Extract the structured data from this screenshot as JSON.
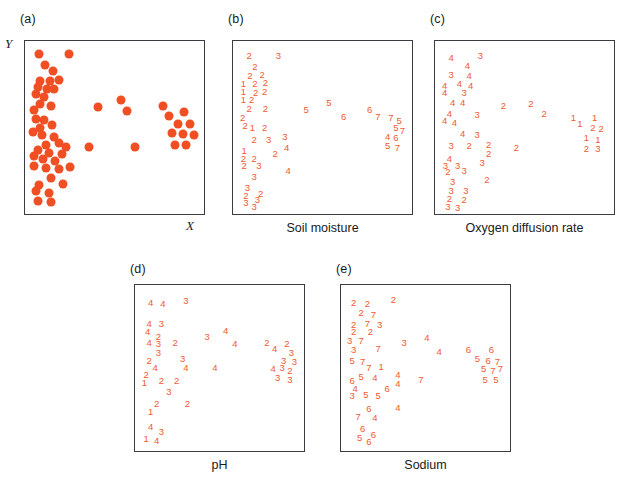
{
  "figure": {
    "type": "multi-panel-scatter-ordination",
    "background": "#ffffff",
    "marker_color": "#f04e23",
    "digit_color": "#ef5a32",
    "axis_color": "#3b3b46"
  },
  "panels": [
    {
      "tag": "(a)",
      "caption": "",
      "xlabel": "X",
      "ylabel": "Y",
      "mode": "dots"
    },
    {
      "tag": "(b)",
      "caption": "Soil moisture",
      "xlabel": "",
      "ylabel": "",
      "mode": "digits"
    },
    {
      "tag": "(c)",
      "caption": "Oxygen diffusion rate",
      "xlabel": "",
      "ylabel": "",
      "mode": "digits"
    },
    {
      "tag": "(d)",
      "caption": "pH",
      "xlabel": "",
      "ylabel": "",
      "mode": "digits"
    },
    {
      "tag": "(e)",
      "caption": "Sodium",
      "xlabel": "",
      "ylabel": "",
      "mode": "digits"
    }
  ],
  "chart_data": {
    "type": "scatter",
    "title": "",
    "xlabel": "X",
    "ylabel": "Y",
    "xlim": [
      0,
      100
    ],
    "ylim": [
      0,
      100
    ],
    "grid": false,
    "legend": "none",
    "points": [
      {
        "x": 5.0,
        "y": 96.0
      },
      {
        "x": 23.0,
        "y": 96.0
      },
      {
        "x": 8.5,
        "y": 89.0
      },
      {
        "x": 13.0,
        "y": 85.5
      },
      {
        "x": 5.5,
        "y": 79.5
      },
      {
        "x": 11.5,
        "y": 79.0
      },
      {
        "x": 16.5,
        "y": 80.0
      },
      {
        "x": 4.0,
        "y": 75.5
      },
      {
        "x": 9.5,
        "y": 74.5
      },
      {
        "x": 14.0,
        "y": 74.0
      },
      {
        "x": 3.0,
        "y": 71.0
      },
      {
        "x": 8.0,
        "y": 69.0
      },
      {
        "x": 5.5,
        "y": 64.5
      },
      {
        "x": 12.0,
        "y": 63.5
      },
      {
        "x": 1.5,
        "y": 61.0
      },
      {
        "x": 40.0,
        "y": 63.0
      },
      {
        "x": 54.0,
        "y": 67.5
      },
      {
        "x": 57.5,
        "y": 60.5
      },
      {
        "x": 79.0,
        "y": 63.5
      },
      {
        "x": 82.5,
        "y": 57.5
      },
      {
        "x": 91.5,
        "y": 59.5
      },
      {
        "x": 3.0,
        "y": 55.5
      },
      {
        "x": 8.0,
        "y": 55.0
      },
      {
        "x": 5.5,
        "y": 50.0
      },
      {
        "x": 12.5,
        "y": 51.5
      },
      {
        "x": 1.0,
        "y": 47.0
      },
      {
        "x": 6.5,
        "y": 45.5
      },
      {
        "x": 13.5,
        "y": 44.0
      },
      {
        "x": 88.0,
        "y": 52.0
      },
      {
        "x": 95.0,
        "y": 52.0
      },
      {
        "x": 84.5,
        "y": 46.5
      },
      {
        "x": 91.0,
        "y": 46.0
      },
      {
        "x": 97.5,
        "y": 45.5
      },
      {
        "x": 9.0,
        "y": 39.0
      },
      {
        "x": 17.0,
        "y": 40.5
      },
      {
        "x": 21.0,
        "y": 38.0
      },
      {
        "x": 4.0,
        "y": 36.0
      },
      {
        "x": 11.0,
        "y": 34.0
      },
      {
        "x": 18.5,
        "y": 33.5
      },
      {
        "x": 35.0,
        "y": 38.0
      },
      {
        "x": 62.0,
        "y": 37.5
      },
      {
        "x": 86.0,
        "y": 39.0
      },
      {
        "x": 93.0,
        "y": 39.0
      },
      {
        "x": 1.5,
        "y": 32.0
      },
      {
        "x": 7.0,
        "y": 30.0
      },
      {
        "x": 14.5,
        "y": 29.0
      },
      {
        "x": 2.0,
        "y": 26.0
      },
      {
        "x": 9.0,
        "y": 24.5
      },
      {
        "x": 16.5,
        "y": 24.0
      },
      {
        "x": 23.5,
        "y": 25.0
      },
      {
        "x": 12.0,
        "y": 18.5
      },
      {
        "x": 5.0,
        "y": 14.0
      },
      {
        "x": 19.0,
        "y": 14.5
      },
      {
        "x": 3.0,
        "y": 10.0
      },
      {
        "x": 10.5,
        "y": 8.5
      },
      {
        "x": 4.0,
        "y": 4.0
      },
      {
        "x": 12.0,
        "y": 3.0
      }
    ],
    "codes": {
      "soil_moisture": [
        2,
        3,
        2,
        2,
        2,
        1,
        2,
        2,
        1,
        2,
        2,
        1,
        2,
        2,
        2,
        5,
        5,
        6,
        6,
        7,
        7,
        2,
        1,
        2,
        2,
        2,
        3,
        3,
        4,
        5,
        7,
        6,
        7,
        1,
        3,
        4,
        2,
        2,
        3,
        4,
        5,
        7,
        5,
        2,
        2,
        2,
        3,
        3,
        3,
        4,
        3,
        3,
        2,
        2,
        3,
        3,
        3
      ],
      "oxygen_diffusion_rate": [
        4,
        3,
        4,
        4,
        3,
        4,
        4,
        4,
        4,
        3,
        4,
        4,
        4,
        3,
        4,
        2,
        2,
        2,
        1,
        1,
        1,
        4,
        4,
        4,
        3,
        3,
        3,
        2,
        2,
        2,
        1,
        1,
        1,
        3,
        2,
        2,
        4,
        3,
        2,
        3,
        2,
        2,
        3,
        3,
        3,
        3,
        2,
        2,
        3,
        2,
        3,
        3,
        3,
        2,
        2,
        3,
        3
      ],
      "ph": [
        4,
        3,
        4,
        4,
        3,
        2,
        4,
        4,
        3,
        2,
        4,
        3,
        2,
        3,
        3,
        3,
        4,
        2,
        4,
        2,
        2,
        2,
        4,
        2,
        4,
        1,
        2,
        2,
        3,
        3,
        3,
        3,
        3,
        2,
        4,
        2,
        2,
        3,
        2,
        4,
        4,
        4,
        3,
        1,
        2,
        3,
        2,
        1,
        2,
        4,
        3,
        1,
        4
      ],
      "sodium": [
        2,
        2,
        2,
        7,
        2,
        7,
        3,
        2,
        2,
        3,
        7,
        7,
        3,
        7,
        5,
        7,
        1,
        7,
        5,
        4,
        4,
        6,
        4,
        4,
        6,
        4,
        5,
        5,
        6,
        5,
        6,
        7,
        5,
        7,
        6,
        4,
        4,
        5,
        5,
        6,
        7,
        4,
        6,
        6,
        5,
        5
      ]
    }
  },
  "panel_b_digits": [
    {
      "x": 5,
      "y": 96,
      "v": "2"
    },
    {
      "x": 23,
      "y": 96,
      "v": "3"
    },
    {
      "x": 8.5,
      "y": 89,
      "v": "2"
    },
    {
      "x": 5.5,
      "y": 83,
      "v": "2"
    },
    {
      "x": 13,
      "y": 84,
      "v": "2"
    },
    {
      "x": 1.5,
      "y": 78,
      "v": "1"
    },
    {
      "x": 8.5,
      "y": 78,
      "v": "2"
    },
    {
      "x": 15,
      "y": 79,
      "v": "2"
    },
    {
      "x": 1.5,
      "y": 73,
      "v": "1"
    },
    {
      "x": 9,
      "y": 72,
      "v": "2"
    },
    {
      "x": 14.5,
      "y": 73,
      "v": "2"
    },
    {
      "x": 1.5,
      "y": 68,
      "v": "1"
    },
    {
      "x": 6.5,
      "y": 68,
      "v": "2"
    },
    {
      "x": 5,
      "y": 62,
      "v": "2"
    },
    {
      "x": 15,
      "y": 62,
      "v": "2"
    },
    {
      "x": 40,
      "y": 61,
      "v": "5"
    },
    {
      "x": 54,
      "y": 66,
      "v": "5"
    },
    {
      "x": 63,
      "y": 57,
      "v": "6"
    },
    {
      "x": 79,
      "y": 61,
      "v": "6"
    },
    {
      "x": 84,
      "y": 57,
      "v": "7"
    },
    {
      "x": 1,
      "y": 56,
      "v": "2"
    },
    {
      "x": 2.5,
      "y": 51,
      "v": "2"
    },
    {
      "x": 7,
      "y": 50,
      "v": "1"
    },
    {
      "x": 92,
      "y": 56,
      "v": "7"
    },
    {
      "x": 97,
      "y": 54,
      "v": "5"
    },
    {
      "x": 95,
      "y": 50,
      "v": "5"
    },
    {
      "x": 99,
      "y": 48,
      "v": "7"
    },
    {
      "x": 14.5,
      "y": 50,
      "v": "2"
    },
    {
      "x": 90,
      "y": 44,
      "v": "4"
    },
    {
      "x": 95,
      "y": 43,
      "v": "6"
    },
    {
      "x": 90,
      "y": 38,
      "v": "5"
    },
    {
      "x": 96,
      "y": 37,
      "v": "7"
    },
    {
      "x": 8,
      "y": 42,
      "v": "2"
    },
    {
      "x": 17,
      "y": 42,
      "v": "3"
    },
    {
      "x": 27,
      "y": 44,
      "v": "3"
    },
    {
      "x": 28,
      "y": 37,
      "v": "4"
    },
    {
      "x": 2,
      "y": 35,
      "v": "1"
    },
    {
      "x": 21,
      "y": 33,
      "v": "2"
    },
    {
      "x": 1.5,
      "y": 30,
      "v": "2"
    },
    {
      "x": 8,
      "y": 30,
      "v": "2"
    },
    {
      "x": 2,
      "y": 25,
      "v": "2"
    },
    {
      "x": 11,
      "y": 25,
      "v": "3"
    },
    {
      "x": 29,
      "y": 22,
      "v": "4"
    },
    {
      "x": 8,
      "y": 18,
      "v": "3"
    },
    {
      "x": 4,
      "y": 11,
      "v": "3"
    },
    {
      "x": 3,
      "y": 6,
      "v": "2"
    },
    {
      "x": 12,
      "y": 7,
      "v": "2"
    },
    {
      "x": 10,
      "y": 3,
      "v": "3"
    },
    {
      "x": 3,
      "y": 1,
      "v": "3"
    },
    {
      "x": 8,
      "y": -1,
      "v": "3"
    }
  ],
  "panel_c_digits": [
    {
      "x": 5,
      "y": 95,
      "v": "4"
    },
    {
      "x": 23,
      "y": 96,
      "v": "3"
    },
    {
      "x": 15,
      "y": 90,
      "v": "4"
    },
    {
      "x": 5,
      "y": 84,
      "v": "3"
    },
    {
      "x": 16,
      "y": 83,
      "v": "4"
    },
    {
      "x": 1,
      "y": 77,
      "v": "4"
    },
    {
      "x": 10,
      "y": 78,
      "v": "4"
    },
    {
      "x": 17,
      "y": 77,
      "v": "4"
    },
    {
      "x": 1,
      "y": 72,
      "v": "4"
    },
    {
      "x": 13,
      "y": 72,
      "v": "3"
    },
    {
      "x": 6,
      "y": 66,
      "v": "4"
    },
    {
      "x": 12,
      "y": 66,
      "v": "4"
    },
    {
      "x": 37,
      "y": 64,
      "v": "2"
    },
    {
      "x": 54,
      "y": 65,
      "v": "2"
    },
    {
      "x": 62,
      "y": 59,
      "v": "2"
    },
    {
      "x": 4,
      "y": 59,
      "v": "4"
    },
    {
      "x": 21,
      "y": 58,
      "v": "3"
    },
    {
      "x": 1,
      "y": 54,
      "v": "4"
    },
    {
      "x": 7,
      "y": 53,
      "v": "4"
    },
    {
      "x": 80,
      "y": 56,
      "v": "1"
    },
    {
      "x": 84,
      "y": 52,
      "v": "1"
    },
    {
      "x": 93,
      "y": 56,
      "v": "1"
    },
    {
      "x": 92,
      "y": 50,
      "v": "2"
    },
    {
      "x": 97,
      "y": 49,
      "v": "2"
    },
    {
      "x": 12,
      "y": 46,
      "v": "4"
    },
    {
      "x": 21,
      "y": 45,
      "v": "3"
    },
    {
      "x": 88,
      "y": 43,
      "v": "1"
    },
    {
      "x": 95,
      "y": 42,
      "v": "1"
    },
    {
      "x": 88,
      "y": 36,
      "v": "2"
    },
    {
      "x": 95,
      "y": 36,
      "v": "3"
    },
    {
      "x": 5,
      "y": 38,
      "v": "3"
    },
    {
      "x": 16,
      "y": 38,
      "v": "2"
    },
    {
      "x": 28,
      "y": 39,
      "v": "2"
    },
    {
      "x": 28,
      "y": 33,
      "v": "2"
    },
    {
      "x": 45,
      "y": 37,
      "v": "2"
    },
    {
      "x": 4,
      "y": 30,
      "v": "4"
    },
    {
      "x": 1.5,
      "y": 25,
      "v": "3"
    },
    {
      "x": 9,
      "y": 25,
      "v": "3"
    },
    {
      "x": 24,
      "y": 27,
      "v": "3"
    },
    {
      "x": 3,
      "y": 21,
      "v": "2"
    },
    {
      "x": 13,
      "y": 22,
      "v": "3"
    },
    {
      "x": 27,
      "y": 16,
      "v": "2"
    },
    {
      "x": 6,
      "y": 15,
      "v": "3"
    },
    {
      "x": 5,
      "y": 9,
      "v": "3"
    },
    {
      "x": 14,
      "y": 9,
      "v": "3"
    },
    {
      "x": 4,
      "y": 4,
      "v": "2"
    },
    {
      "x": 13,
      "y": 3,
      "v": "2"
    },
    {
      "x": 3,
      "y": -1,
      "v": "3"
    },
    {
      "x": 9,
      "y": -2,
      "v": "3"
    }
  ],
  "panel_d_digits": [
    {
      "x": 5,
      "y": 94,
      "v": "4"
    },
    {
      "x": 13,
      "y": 93,
      "v": "4"
    },
    {
      "x": 28,
      "y": 95,
      "v": "3"
    },
    {
      "x": 4,
      "y": 80,
      "v": "4"
    },
    {
      "x": 12,
      "y": 80,
      "v": "3"
    },
    {
      "x": 3,
      "y": 74,
      "v": "4"
    },
    {
      "x": 10,
      "y": 71,
      "v": "2"
    },
    {
      "x": 42,
      "y": 71,
      "v": "3"
    },
    {
      "x": 54,
      "y": 75,
      "v": "4"
    },
    {
      "x": 4,
      "y": 67,
      "v": "4"
    },
    {
      "x": 10,
      "y": 66,
      "v": "3"
    },
    {
      "x": 21,
      "y": 67,
      "v": "2"
    },
    {
      "x": 60,
      "y": 66,
      "v": "4"
    },
    {
      "x": 81,
      "y": 67,
      "v": "2"
    },
    {
      "x": 86,
      "y": 63,
      "v": "4"
    },
    {
      "x": 94,
      "y": 66,
      "v": "2"
    },
    {
      "x": 10,
      "y": 60,
      "v": "3"
    },
    {
      "x": 97,
      "y": 60,
      "v": "3"
    },
    {
      "x": 4,
      "y": 55,
      "v": "2"
    },
    {
      "x": 26,
      "y": 56,
      "v": "3"
    },
    {
      "x": 92,
      "y": 55,
      "v": "3"
    },
    {
      "x": 99,
      "y": 54,
      "v": "3"
    },
    {
      "x": 8,
      "y": 50,
      "v": "4"
    },
    {
      "x": 28,
      "y": 50,
      "v": "4"
    },
    {
      "x": 47,
      "y": 50,
      "v": "4"
    },
    {
      "x": 85,
      "y": 49,
      "v": "4"
    },
    {
      "x": 91,
      "y": 50,
      "v": "3"
    },
    {
      "x": 96,
      "y": 48,
      "v": "2"
    },
    {
      "x": 2,
      "y": 45,
      "v": "2"
    },
    {
      "x": 88,
      "y": 43,
      "v": "3"
    },
    {
      "x": 96,
      "y": 42,
      "v": "3"
    },
    {
      "x": 1,
      "y": 40,
      "v": "1"
    },
    {
      "x": 12,
      "y": 41,
      "v": "2"
    },
    {
      "x": 22,
      "y": 41,
      "v": "2"
    },
    {
      "x": 17,
      "y": 34,
      "v": "3"
    },
    {
      "x": 9,
      "y": 26,
      "v": "2"
    },
    {
      "x": 29,
      "y": 26,
      "v": "2"
    },
    {
      "x": 5,
      "y": 20,
      "v": "1"
    },
    {
      "x": 5,
      "y": 10,
      "v": "4"
    },
    {
      "x": 12,
      "y": 7,
      "v": "3"
    },
    {
      "x": 2,
      "y": 2,
      "v": "1"
    },
    {
      "x": 9,
      "y": 1,
      "v": "4"
    }
  ],
  "panel_e_digits": [
    {
      "x": 3,
      "y": 94,
      "v": "2"
    },
    {
      "x": 12,
      "y": 93,
      "v": "2"
    },
    {
      "x": 29,
      "y": 96,
      "v": "2"
    },
    {
      "x": 8,
      "y": 87,
      "v": "2"
    },
    {
      "x": 16,
      "y": 86,
      "v": "7"
    },
    {
      "x": 3,
      "y": 79,
      "v": "2"
    },
    {
      "x": 12,
      "y": 80,
      "v": "7"
    },
    {
      "x": 20,
      "y": 79,
      "v": "3"
    },
    {
      "x": 3,
      "y": 74,
      "v": "2"
    },
    {
      "x": 14,
      "y": 74,
      "v": "2"
    },
    {
      "x": 0.5,
      "y": 68,
      "v": "3"
    },
    {
      "x": 8,
      "y": 68,
      "v": "7"
    },
    {
      "x": 36,
      "y": 67,
      "v": "3"
    },
    {
      "x": 51,
      "y": 70,
      "v": "4"
    },
    {
      "x": 3,
      "y": 62,
      "v": "3"
    },
    {
      "x": 19,
      "y": 63,
      "v": "7"
    },
    {
      "x": 59,
      "y": 61,
      "v": "4"
    },
    {
      "x": 78,
      "y": 62,
      "v": "6"
    },
    {
      "x": 93,
      "y": 62,
      "v": "6"
    },
    {
      "x": 2,
      "y": 55,
      "v": "5"
    },
    {
      "x": 9,
      "y": 54,
      "v": "7"
    },
    {
      "x": 84,
      "y": 56,
      "v": "5"
    },
    {
      "x": 91,
      "y": 55,
      "v": "6"
    },
    {
      "x": 97,
      "y": 54,
      "v": "7"
    },
    {
      "x": 13,
      "y": 50,
      "v": "7"
    },
    {
      "x": 21,
      "y": 51,
      "v": "1"
    },
    {
      "x": 88,
      "y": 49,
      "v": "5"
    },
    {
      "x": 94,
      "y": 48,
      "v": "7"
    },
    {
      "x": 99,
      "y": 49,
      "v": "7"
    },
    {
      "x": 8,
      "y": 44,
      "v": "5"
    },
    {
      "x": 17,
      "y": 43,
      "v": "4"
    },
    {
      "x": 32,
      "y": 45,
      "v": "4"
    },
    {
      "x": 47,
      "y": 42,
      "v": "7"
    },
    {
      "x": 89,
      "y": 42,
      "v": "5"
    },
    {
      "x": 96,
      "y": 42,
      "v": "5"
    },
    {
      "x": 2,
      "y": 41,
      "v": "6"
    },
    {
      "x": 32,
      "y": 39,
      "v": "4"
    },
    {
      "x": 4,
      "y": 36,
      "v": "4"
    },
    {
      "x": 25,
      "y": 36,
      "v": "6"
    },
    {
      "x": 2,
      "y": 31,
      "v": "3"
    },
    {
      "x": 11,
      "y": 32,
      "v": "5"
    },
    {
      "x": 19,
      "y": 31,
      "v": "5"
    },
    {
      "x": 13,
      "y": 22,
      "v": "6"
    },
    {
      "x": 32,
      "y": 23,
      "v": "4"
    },
    {
      "x": 6,
      "y": 17,
      "v": "7"
    },
    {
      "x": 17,
      "y": 16,
      "v": "4"
    },
    {
      "x": 9,
      "y": 9,
      "v": "6"
    },
    {
      "x": 7,
      "y": 3,
      "v": "5"
    },
    {
      "x": 16,
      "y": 5,
      "v": "6"
    },
    {
      "x": 13,
      "y": 0,
      "v": "6"
    }
  ]
}
